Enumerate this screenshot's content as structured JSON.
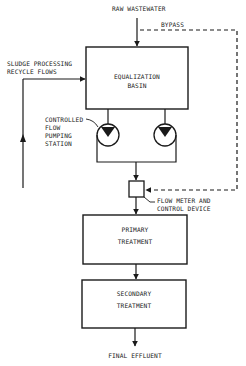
{
  "diagram": {
    "type": "process-flow",
    "colors": {
      "line": "#1a1a1a",
      "background": "#ffffff"
    },
    "inputs": {
      "raw_wastewater": "RAW WASTEWATER",
      "bypass": "BYPASS",
      "sludge_line1": "SLUDGE PROCESSING",
      "sludge_line2": "RECYCLE FLOWS"
    },
    "nodes": {
      "equalization_line1": "EQUALIZATION",
      "equalization_line2": "BASIN",
      "pumping_line1": "CONTROLLED",
      "pumping_line2": "FLOW",
      "pumping_line3": "PUMPING",
      "pumping_line4": "STATION",
      "flowmeter_line1": "FLOW METER AND",
      "flowmeter_line2": "CONTROL DEVICE",
      "primary_line1": "PRIMARY",
      "primary_line2": "TREATMENT",
      "secondary_line1": "SECONDARY",
      "secondary_line2": "TREATMENT"
    },
    "outputs": {
      "final_effluent": "FINAL EFFLUENT"
    }
  }
}
